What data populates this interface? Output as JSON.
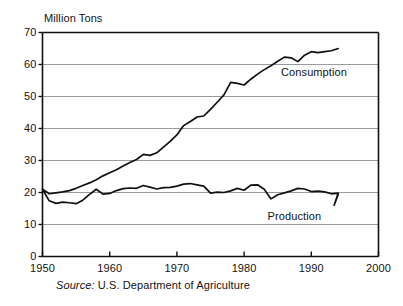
{
  "figure": {
    "y_axis_title": "Million Tons",
    "source_lead": "Source:",
    "source_body": " U.S. Department of Agriculture"
  },
  "chart_data": {
    "type": "line",
    "title": "",
    "subtitle": "",
    "xlabel": "",
    "ylabel": "Million Tons",
    "xlim": [
      1950,
      2000
    ],
    "ylim": [
      0,
      70
    ],
    "xticks": [
      1950,
      1960,
      1970,
      1980,
      1990,
      2000
    ],
    "yticks": [
      0,
      10,
      20,
      30,
      40,
      50,
      60,
      70
    ],
    "grid": "horizontal",
    "legend_position": "inline-annotation",
    "line_color": "#101010",
    "grid_color": "#9a9a9a",
    "axis_color": "#101010",
    "background_color": "#ffffff",
    "annotations": [
      {
        "text": "Consumption",
        "x": 1985.5,
        "y": 57.5
      },
      {
        "text": "Production",
        "x": 1983.5,
        "y": 12.5
      }
    ],
    "series": [
      {
        "name": "Consumption",
        "x": [
          1950,
          1951,
          1952,
          1953,
          1954,
          1955,
          1956,
          1957,
          1958,
          1959,
          1960,
          1961,
          1962,
          1963,
          1964,
          1965,
          1966,
          1967,
          1968,
          1969,
          1970,
          1971,
          1972,
          1973,
          1974,
          1975,
          1976,
          1977,
          1978,
          1979,
          1980,
          1981,
          1982,
          1983,
          1984,
          1985,
          1986,
          1987,
          1988,
          1989,
          1990,
          1991,
          1992,
          1993,
          1994
        ],
        "values": [
          21.0,
          19.6,
          19.9,
          20.2,
          20.6,
          21.3,
          22.2,
          23.0,
          24.0,
          25.2,
          26.2,
          27.1,
          28.3,
          29.4,
          30.3,
          31.9,
          31.6,
          32.4,
          34.2,
          36.0,
          38.0,
          40.9,
          42.2,
          43.6,
          43.9,
          46.0,
          48.2,
          50.5,
          54.4,
          54.1,
          53.6,
          55.4,
          57.0,
          58.4,
          59.6,
          61.0,
          62.3,
          62.1,
          60.9,
          62.9,
          64.0,
          63.7,
          64.0,
          64.3,
          65.0
        ]
      },
      {
        "name": "Production",
        "x": [
          1950,
          1951,
          1952,
          1953,
          1954,
          1955,
          1956,
          1957,
          1958,
          1959,
          1960,
          1961,
          1962,
          1963,
          1964,
          1965,
          1966,
          1967,
          1968,
          1969,
          1970,
          1971,
          1972,
          1973,
          1974,
          1975,
          1976,
          1977,
          1978,
          1979,
          1980,
          1981,
          1982,
          1983,
          1984,
          1985,
          1986,
          1987,
          1988,
          1989,
          1990,
          1991,
          1992,
          1993,
          1994
        ],
        "values": [
          21.0,
          17.4,
          16.6,
          17.0,
          16.8,
          16.5,
          17.6,
          19.4,
          21.0,
          19.5,
          19.7,
          20.6,
          21.2,
          21.4,
          21.3,
          22.2,
          21.7,
          21.1,
          21.5,
          21.6,
          22.0,
          22.6,
          22.8,
          22.4,
          22.0,
          19.8,
          20.1,
          20.0,
          20.5,
          21.3,
          20.7,
          22.3,
          22.4,
          21.0,
          18.0,
          19.3,
          19.9,
          20.5,
          21.3,
          21.1,
          20.3,
          20.4,
          20.2,
          19.6,
          19.8
        ]
      }
    ],
    "production_tail": {
      "dip_year": 1993.4,
      "dip_value": 16.0,
      "end_year": 1994.0,
      "end_value": 19.4
    }
  },
  "axis": {
    "ytick_labels": [
      "70",
      "60",
      "50",
      "40",
      "30",
      "20",
      "10",
      "0"
    ],
    "xtick_labels": [
      "1950",
      "1960",
      "1970",
      "1980",
      "1990",
      "2000"
    ]
  }
}
